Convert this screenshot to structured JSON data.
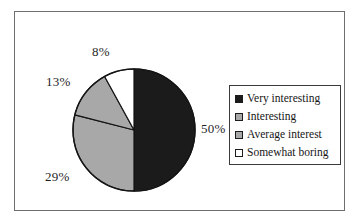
{
  "figure": {
    "background_color": "#ffffff",
    "frame_color": "#2b2b2b"
  },
  "chart_data": {
    "type": "pie",
    "title": "",
    "subtitle": "",
    "xlabel": "",
    "ylabel": "",
    "grid": false,
    "legend_position": "right",
    "start_angle_deg": 0,
    "direction": "clockwise",
    "categories": [
      "Very interesting",
      "Interesting",
      "Average interest",
      "Somewhat boring"
    ],
    "values": [
      50,
      29,
      13,
      8
    ],
    "value_labels": [
      "50%",
      "29%",
      "13%",
      "8%"
    ],
    "colors": [
      "#1b1b1b",
      "#a8a8a8",
      "#a8a8a8",
      "#ffffff"
    ],
    "slice_border_color": "#141414",
    "slices": [
      {
        "label": "Very interesting",
        "value": 50,
        "display": "50%",
        "color": "#1b1b1b"
      },
      {
        "label": "Interesting",
        "value": 29,
        "display": "29%",
        "color": "#a8a8a8"
      },
      {
        "label": "Average interest",
        "value": 13,
        "display": "13%",
        "color": "#a8a8a8"
      },
      {
        "label": "Somewhat boring",
        "value": 8,
        "display": "8%",
        "color": "#ffffff"
      }
    ]
  },
  "callouts": {
    "top": "8%",
    "upper_left": "13%",
    "lower_left": "29%",
    "right": "50%"
  },
  "legend": {
    "items": [
      {
        "label": "Very interesting",
        "swatch_color": "#1b1b1b"
      },
      {
        "label": "Interesting",
        "swatch_color": "#a8a8a8"
      },
      {
        "label": "Average interest",
        "swatch_color": "#a8a8a8"
      },
      {
        "label": "Somewhat boring",
        "swatch_color": "#ffffff"
      }
    ]
  }
}
